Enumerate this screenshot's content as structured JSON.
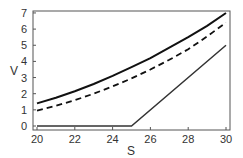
{
  "chart_data": {
    "type": "line",
    "title": "",
    "xlabel": "S",
    "ylabel": "V",
    "xlim": [
      20,
      30
    ],
    "ylim": [
      -0.2,
      7.2
    ],
    "xticks": [
      20,
      22,
      24,
      26,
      28,
      30
    ],
    "yticks": [
      0,
      1,
      2,
      3,
      4,
      5,
      6,
      7
    ],
    "grid": false,
    "legend": null,
    "x": [
      20,
      21,
      22,
      23,
      24,
      25,
      26,
      27,
      28,
      29,
      30
    ],
    "series": [
      {
        "name": "value-solid",
        "style": "solid",
        "values": [
          1.4,
          1.75,
          2.15,
          2.6,
          3.1,
          3.65,
          4.2,
          4.85,
          5.5,
          6.2,
          7.0
        ]
      },
      {
        "name": "value-dashed",
        "style": "dashed",
        "values": [
          0.95,
          1.25,
          1.6,
          2.0,
          2.45,
          2.95,
          3.5,
          4.1,
          4.75,
          5.55,
          6.4
        ]
      },
      {
        "name": "payoff",
        "style": "solid-thin",
        "values": [
          0,
          0,
          0,
          0,
          0,
          0,
          1,
          2,
          3,
          4,
          5
        ]
      }
    ]
  },
  "axes": {
    "x_label": "S",
    "y_label": "V"
  }
}
